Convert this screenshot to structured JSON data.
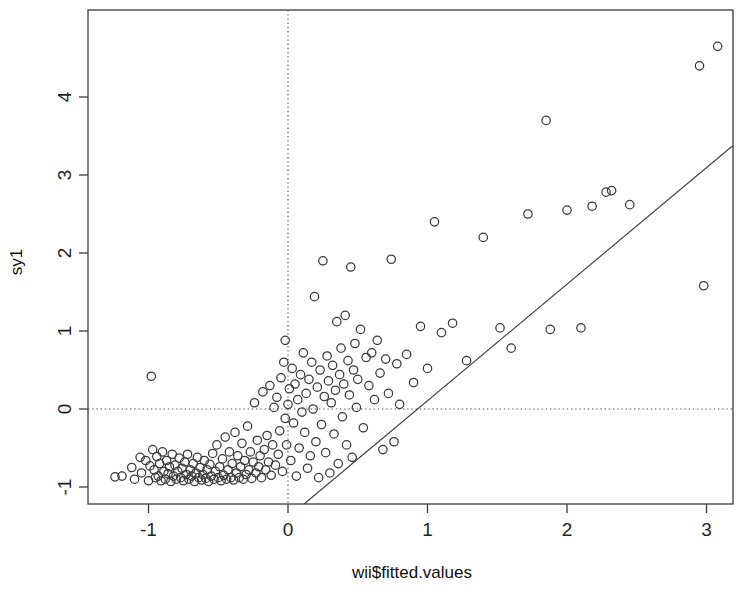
{
  "chart_data": {
    "type": "scatter",
    "title": "",
    "subtitle": "",
    "xlabel": "wii$fitted.values",
    "ylabel": "sy1",
    "xlim": [
      -1.43,
      3.19
    ],
    "ylim": [
      -1.22,
      4.87
    ],
    "xticks": [
      -1,
      0,
      1,
      2,
      3
    ],
    "xtick_labels": [
      "-1",
      "0",
      "1",
      "2",
      "3"
    ],
    "yticks": [
      -1,
      0,
      1,
      2,
      3,
      4
    ],
    "ytick_labels": [
      "-1",
      "0",
      "1",
      "2",
      "3",
      "4"
    ],
    "grid": false,
    "legend": null,
    "reference_lines": [
      {
        "name": "horizontal-zero-line",
        "orientation": "horizontal",
        "value": 0,
        "style": "dotted"
      },
      {
        "name": "vertical-zero-line",
        "orientation": "vertical",
        "value": 0,
        "style": "dotted"
      }
    ],
    "fit_line": {
      "name": "regression-line",
      "slope": 1.495,
      "intercept": -1.39,
      "x_start": 0.115,
      "x_end": 3.19,
      "style": "solid"
    },
    "marker": "open-circle",
    "points": [
      [
        -1.24,
        -0.87
      ],
      [
        -1.19,
        -0.86
      ],
      [
        -1.12,
        -0.75
      ],
      [
        -1.1,
        -0.9
      ],
      [
        -1.06,
        -0.62
      ],
      [
        -1.05,
        -0.82
      ],
      [
        -1.02,
        -0.66
      ],
      [
        -1.0,
        -0.92
      ],
      [
        -0.99,
        -0.73
      ],
      [
        -0.98,
        0.42
      ],
      [
        -0.97,
        -0.52
      ],
      [
        -0.96,
        -0.78
      ],
      [
        -0.95,
        -0.88
      ],
      [
        -0.94,
        -0.61
      ],
      [
        -0.93,
        -0.86
      ],
      [
        -0.92,
        -0.7
      ],
      [
        -0.91,
        -0.92
      ],
      [
        -0.9,
        -0.55
      ],
      [
        -0.89,
        -0.8
      ],
      [
        -0.88,
        -0.9
      ],
      [
        -0.87,
        -0.66
      ],
      [
        -0.86,
        -0.83
      ],
      [
        -0.85,
        -0.74
      ],
      [
        -0.84,
        -0.93
      ],
      [
        -0.83,
        -0.58
      ],
      [
        -0.82,
        -0.86
      ],
      [
        -0.81,
        -0.72
      ],
      [
        -0.8,
        -0.9
      ],
      [
        -0.79,
        -0.8
      ],
      [
        -0.78,
        -0.63
      ],
      [
        -0.77,
        -0.88
      ],
      [
        -0.76,
        -0.76
      ],
      [
        -0.75,
        -0.92
      ],
      [
        -0.74,
        -0.68
      ],
      [
        -0.73,
        -0.84
      ],
      [
        -0.72,
        -0.58
      ],
      [
        -0.71,
        -0.9
      ],
      [
        -0.7,
        -0.78
      ],
      [
        -0.69,
        -0.86
      ],
      [
        -0.68,
        -0.7
      ],
      [
        -0.67,
        -0.93
      ],
      [
        -0.66,
        -0.82
      ],
      [
        -0.65,
        -0.62
      ],
      [
        -0.64,
        -0.88
      ],
      [
        -0.63,
        -0.75
      ],
      [
        -0.62,
        -0.91
      ],
      [
        -0.61,
        -0.84
      ],
      [
        -0.6,
        -0.66
      ],
      [
        -0.59,
        -0.89
      ],
      [
        -0.58,
        -0.78
      ],
      [
        -0.57,
        -0.93
      ],
      [
        -0.56,
        -0.71
      ],
      [
        -0.55,
        -0.86
      ],
      [
        -0.54,
        -0.57
      ],
      [
        -0.53,
        -0.9
      ],
      [
        -0.52,
        -0.8
      ],
      [
        -0.51,
        -0.46
      ],
      [
        -0.5,
        -0.88
      ],
      [
        -0.49,
        -0.74
      ],
      [
        -0.48,
        -0.92
      ],
      [
        -0.47,
        -0.64
      ],
      [
        -0.46,
        -0.85
      ],
      [
        -0.45,
        -0.36
      ],
      [
        -0.44,
        -0.9
      ],
      [
        -0.43,
        -0.78
      ],
      [
        -0.42,
        -0.55
      ],
      [
        -0.41,
        -0.88
      ],
      [
        -0.4,
        -0.7
      ],
      [
        -0.39,
        -0.91
      ],
      [
        -0.38,
        -0.3
      ],
      [
        -0.37,
        -0.82
      ],
      [
        -0.36,
        -0.6
      ],
      [
        -0.35,
        -0.88
      ],
      [
        -0.34,
        -0.74
      ],
      [
        -0.33,
        -0.44
      ],
      [
        -0.32,
        -0.9
      ],
      [
        -0.31,
        -0.66
      ],
      [
        -0.3,
        -0.84
      ],
      [
        -0.29,
        -0.22
      ],
      [
        -0.28,
        -0.78
      ],
      [
        -0.27,
        -0.55
      ],
      [
        -0.26,
        -0.89
      ],
      [
        -0.25,
        -0.68
      ],
      [
        -0.24,
        0.08
      ],
      [
        -0.23,
        -0.82
      ],
      [
        -0.22,
        -0.4
      ],
      [
        -0.21,
        -0.74
      ],
      [
        -0.2,
        -0.6
      ],
      [
        -0.19,
        -0.88
      ],
      [
        -0.18,
        0.22
      ],
      [
        -0.17,
        -0.52
      ],
      [
        -0.16,
        -0.78
      ],
      [
        -0.15,
        -0.34
      ],
      [
        -0.14,
        -0.68
      ],
      [
        -0.13,
        0.3
      ],
      [
        -0.12,
        -0.85
      ],
      [
        -0.11,
        -0.46
      ],
      [
        -0.1,
        0.02
      ],
      [
        -0.09,
        -0.72
      ],
      [
        -0.08,
        0.15
      ],
      [
        -0.07,
        -0.58
      ],
      [
        -0.06,
        -0.28
      ],
      [
        -0.05,
        0.4
      ],
      [
        -0.04,
        -0.8
      ],
      [
        -0.03,
        0.6
      ],
      [
        -0.02,
        -0.12
      ],
      [
        -0.02,
        0.88
      ],
      [
        -0.01,
        -0.46
      ],
      [
        0.0,
        0.06
      ],
      [
        0.01,
        0.26
      ],
      [
        0.02,
        -0.66
      ],
      [
        0.03,
        0.52
      ],
      [
        0.04,
        -0.18
      ],
      [
        0.05,
        0.32
      ],
      [
        0.06,
        -0.86
      ],
      [
        0.07,
        0.12
      ],
      [
        0.08,
        -0.5
      ],
      [
        0.09,
        0.44
      ],
      [
        0.1,
        -0.04
      ],
      [
        0.11,
        0.72
      ],
      [
        0.12,
        -0.3
      ],
      [
        0.13,
        0.2
      ],
      [
        0.14,
        -0.76
      ],
      [
        0.15,
        0.38
      ],
      [
        0.16,
        -0.6
      ],
      [
        0.17,
        0.6
      ],
      [
        0.18,
        0.0
      ],
      [
        0.19,
        1.44
      ],
      [
        0.2,
        -0.42
      ],
      [
        0.21,
        0.28
      ],
      [
        0.22,
        -0.88
      ],
      [
        0.23,
        0.5
      ],
      [
        0.24,
        -0.2
      ],
      [
        0.25,
        1.9
      ],
      [
        0.26,
        0.16
      ],
      [
        0.27,
        -0.56
      ],
      [
        0.28,
        0.68
      ],
      [
        0.29,
        0.36
      ],
      [
        0.3,
        -0.82
      ],
      [
        0.31,
        0.08
      ],
      [
        0.32,
        0.56
      ],
      [
        0.33,
        -0.32
      ],
      [
        0.34,
        0.24
      ],
      [
        0.35,
        1.12
      ],
      [
        0.36,
        -0.7
      ],
      [
        0.37,
        0.44
      ],
      [
        0.38,
        0.78
      ],
      [
        0.39,
        -0.1
      ],
      [
        0.4,
        0.32
      ],
      [
        0.41,
        1.2
      ],
      [
        0.42,
        -0.46
      ],
      [
        0.43,
        0.62
      ],
      [
        0.44,
        0.18
      ],
      [
        0.45,
        1.82
      ],
      [
        0.46,
        -0.62
      ],
      [
        0.47,
        0.5
      ],
      [
        0.48,
        0.84
      ],
      [
        0.49,
        0.02
      ],
      [
        0.5,
        0.38
      ],
      [
        0.52,
        1.02
      ],
      [
        0.54,
        -0.24
      ],
      [
        0.56,
        0.66
      ],
      [
        0.58,
        0.3
      ],
      [
        0.6,
        0.72
      ],
      [
        0.62,
        0.12
      ],
      [
        0.64,
        0.88
      ],
      [
        0.66,
        0.46
      ],
      [
        0.68,
        -0.52
      ],
      [
        0.7,
        0.64
      ],
      [
        0.72,
        0.2
      ],
      [
        0.74,
        1.92
      ],
      [
        0.76,
        -0.42
      ],
      [
        0.78,
        0.58
      ],
      [
        0.8,
        0.06
      ],
      [
        0.85,
        0.7
      ],
      [
        0.9,
        0.34
      ],
      [
        0.95,
        1.06
      ],
      [
        1.0,
        0.52
      ],
      [
        1.05,
        2.4
      ],
      [
        1.1,
        0.98
      ],
      [
        1.18,
        1.1
      ],
      [
        1.28,
        0.62
      ],
      [
        1.4,
        2.2
      ],
      [
        1.52,
        1.04
      ],
      [
        1.6,
        0.78
      ],
      [
        1.72,
        2.5
      ],
      [
        1.85,
        3.7
      ],
      [
        1.88,
        1.02
      ],
      [
        2.0,
        2.55
      ],
      [
        2.1,
        1.04
      ],
      [
        2.18,
        2.6
      ],
      [
        2.28,
        2.78
      ],
      [
        2.32,
        2.8
      ],
      [
        2.45,
        2.62
      ],
      [
        2.95,
        4.4
      ],
      [
        2.98,
        1.58
      ],
      [
        3.08,
        4.65
      ]
    ],
    "n_points": 177
  },
  "axis": {
    "x_title": "wii$fitted.values",
    "y_title": "sy1"
  }
}
